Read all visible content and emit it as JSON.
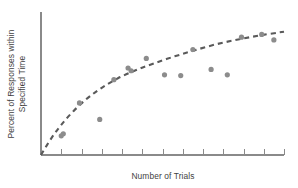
{
  "chart_data": {
    "type": "scatter",
    "title": "",
    "subtitle": "",
    "xlabel": "Number of Trials",
    "ylabel_line1": "Percent of Responses within",
    "ylabel_line2": "Specified Time",
    "ylabel": "Percent of Responses within Specified Time",
    "grid": false,
    "legend": null,
    "xlim": [
      0,
      12
    ],
    "ylim": [
      0,
      100
    ],
    "x_tick_count": 12,
    "x_tick_labels": [],
    "y_tick_labels": [],
    "axis_color": "#8a8a8a",
    "point_color": "#8c8c8c",
    "curve_color": "#5a5a5a",
    "curve_style": "dashed",
    "point_radius": 2.6,
    "x": [
      1.0,
      1.1,
      1.9,
      2.9,
      3.6,
      4.3,
      4.45,
      5.2,
      6.1,
      6.9,
      7.5,
      8.4,
      9.2,
      9.9,
      10.9,
      11.5
    ],
    "y": [
      14.0,
      15.5,
      38.0,
      26.0,
      55.0,
      63.5,
      61.5,
      70.5,
      58.5,
      58.0,
      77.0,
      62.5,
      58.5,
      86.0,
      88.0,
      84.0
    ],
    "series": [
      {
        "name": "observed responses",
        "points": [
          {
            "x": 1.0,
            "y": 14.0
          },
          {
            "x": 1.1,
            "y": 15.5
          },
          {
            "x": 1.9,
            "y": 38.0
          },
          {
            "x": 2.9,
            "y": 26.0
          },
          {
            "x": 3.6,
            "y": 55.0
          },
          {
            "x": 4.3,
            "y": 63.5
          },
          {
            "x": 4.45,
            "y": 61.5
          },
          {
            "x": 5.2,
            "y": 70.5
          },
          {
            "x": 6.1,
            "y": 58.5
          },
          {
            "x": 6.9,
            "y": 58.0
          },
          {
            "x": 7.5,
            "y": 77.0
          },
          {
            "x": 8.4,
            "y": 62.5
          },
          {
            "x": 9.2,
            "y": 58.5
          },
          {
            "x": 9.9,
            "y": 86.0
          },
          {
            "x": 10.9,
            "y": 88.0
          },
          {
            "x": 11.5,
            "y": 84.0
          }
        ]
      }
    ],
    "trend": {
      "name": "fitted learning curve",
      "style": "dashed",
      "description": "negatively accelerated curve rising steeply then flattening",
      "points": [
        {
          "x": 0.0,
          "y": 0.0
        },
        {
          "x": 0.5,
          "y": 12.0
        },
        {
          "x": 1.0,
          "y": 22.0
        },
        {
          "x": 1.6,
          "y": 32.0
        },
        {
          "x": 2.3,
          "y": 41.5
        },
        {
          "x": 3.0,
          "y": 49.0
        },
        {
          "x": 3.8,
          "y": 56.0
        },
        {
          "x": 4.7,
          "y": 62.0
        },
        {
          "x": 5.6,
          "y": 67.0
        },
        {
          "x": 6.6,
          "y": 72.0
        },
        {
          "x": 7.6,
          "y": 76.5
        },
        {
          "x": 8.7,
          "y": 81.0
        },
        {
          "x": 9.8,
          "y": 84.5
        },
        {
          "x": 10.9,
          "y": 87.5
        },
        {
          "x": 12.0,
          "y": 90.0
        }
      ]
    }
  }
}
